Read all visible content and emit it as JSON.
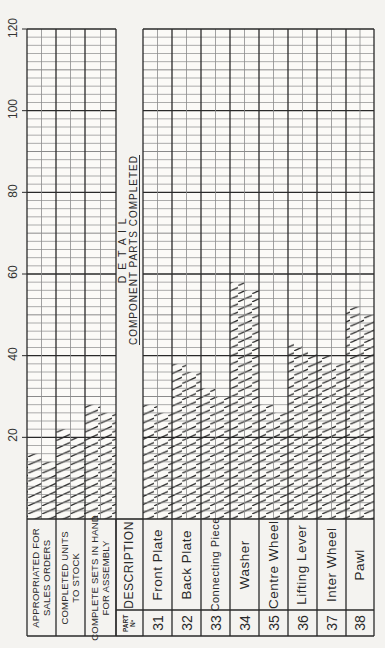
{
  "chart_data": {
    "type": "bar",
    "orientation": "rotated-90-ccw (bars grow upward in image, text reads bottom-to-top)",
    "axis": {
      "ticks": [
        20,
        40,
        60,
        80,
        100,
        120
      ],
      "range": [
        0,
        120
      ],
      "minor_grid_step": 2,
      "grid": true
    },
    "header_series": {
      "categories": [
        "APPROPRIATED FOR SALES ORDERS",
        "COMPLETED UNITS TO STOCK",
        "COMPLETE SETS IN HAND FOR ASSEMBLY"
      ],
      "values": [
        16,
        22,
        28
      ]
    },
    "detail_series": {
      "part_numbers": [
        "31",
        "32",
        "33",
        "34",
        "35",
        "36",
        "37",
        "38"
      ],
      "categories": [
        "Front Plate",
        "Back Plate",
        "Connecting Piece",
        "Washer",
        "Centre Wheel",
        "Lifting Lever",
        "Inter Wheel",
        "Pawl"
      ],
      "values": [
        28,
        38,
        32,
        58,
        28,
        43,
        40,
        52
      ]
    }
  },
  "axis_labels": [
    "20",
    "40",
    "60",
    "80",
    "100",
    "120"
  ],
  "header_rows": [
    {
      "line1": "APPROPRIATED FOR",
      "line2": "SALES ORDERS",
      "value": 16
    },
    {
      "line1": "COMPLETED UNITS",
      "line2": "TO STOCK",
      "value": 22
    },
    {
      "line1": "COMPLETE SETS IN HAND",
      "line2": "FOR ASSEMBLY",
      "value": 28
    }
  ],
  "detail_title": {
    "line1": "D E T A I L",
    "line2": "COMPONENT PARTS COMPLETED"
  },
  "table_header": {
    "part_no": "PART Nº",
    "part_line1": "PART",
    "part_line2": "Nº",
    "description": "DESCRIPTION"
  },
  "parts": [
    {
      "no": "31",
      "name": "Front Plate",
      "value": 28
    },
    {
      "no": "32",
      "name": "Back Plate",
      "value": 38
    },
    {
      "no": "33",
      "name": "Connecting Piece",
      "value": 32
    },
    {
      "no": "34",
      "name": "Washer",
      "value": 58
    },
    {
      "no": "35",
      "name": "Centre Wheel",
      "value": 28
    },
    {
      "no": "36",
      "name": "Lifting Lever",
      "value": 43
    },
    {
      "no": "37",
      "name": "Inter Wheel",
      "value": 40
    },
    {
      "no": "38",
      "name": "Pawl",
      "value": 52
    }
  ],
  "colors": {
    "paper": "#f4f3f0",
    "ink": "#2a2a2a",
    "grid_light": "#8a8a8a"
  }
}
